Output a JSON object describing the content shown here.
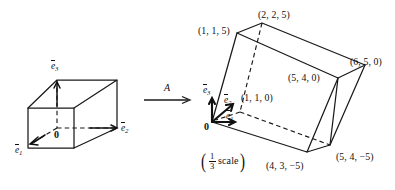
{
  "figure": {
    "background_color": "#ffffff",
    "ink_color": "#111111"
  },
  "map_arrow": {
    "label": "A",
    "icon": "right-arrow-icon"
  },
  "scale_note": {
    "open_paren": "(",
    "numerator": "1",
    "denominator": "3",
    "word": "scale",
    "close_paren": ")",
    "full_text": "(1/3 scale)"
  },
  "left_cube": {
    "name": "unit-cube",
    "origin_label": "0",
    "basis_vectors": [
      {
        "symbol": "e",
        "subscript": "1",
        "direction": "front-left-down"
      },
      {
        "symbol": "e",
        "subscript": "2",
        "direction": "right"
      },
      {
        "symbol": "e",
        "subscript": "3",
        "direction": "up"
      }
    ]
  },
  "right_solid": {
    "name": "image-parallelepiped",
    "origin_label": "0",
    "basis_vectors": [
      {
        "symbol": "e",
        "subscript": "1",
        "direction": "right"
      },
      {
        "symbol": "e",
        "subscript": "2",
        "direction": "up-right"
      },
      {
        "symbol": "e",
        "subscript": "3",
        "direction": "up"
      }
    ],
    "vertex_labels": [
      {
        "id": "v-1-1-5",
        "text": "(1, 1, 5)"
      },
      {
        "id": "v-2-2-5",
        "text": "(2, 2, 5)"
      },
      {
        "id": "v-6-5-0",
        "text": "(6, 5, 0)"
      },
      {
        "id": "v-5-4-0",
        "text": "(5, 4, 0)"
      },
      {
        "id": "v-1-1-0",
        "text": "(1, 1, 0)"
      },
      {
        "id": "v-5-4-m5",
        "text": "(5, 4, −5)"
      },
      {
        "id": "v-4-3-m5",
        "text": "(4, 3, −5)"
      }
    ]
  }
}
